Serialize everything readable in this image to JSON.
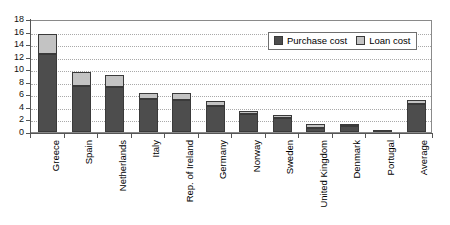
{
  "chart_data": {
    "type": "bar",
    "title": "",
    "subtitle": "",
    "xlabel": "",
    "ylabel": "",
    "stacked": true,
    "grid": true,
    "legend_position": "top-right",
    "ylim": [
      0,
      18
    ],
    "ytick_step": 2,
    "yticks": [
      "0",
      "2",
      "4",
      "6",
      "8",
      "10",
      "12",
      "14",
      "16",
      "18"
    ],
    "categories": [
      "Greece",
      "Spain",
      "Netherlands",
      "Italy",
      "Rep. of Ireland",
      "Germany",
      "Norway",
      "Sweden",
      "United Kingdom",
      "Denmark",
      "Portugal",
      "Average"
    ],
    "series": [
      {
        "name": "Purchase cost",
        "color": "#4d4d4d",
        "values": [
          12.5,
          7.3,
          7.1,
          5.2,
          5.1,
          4.1,
          2.9,
          2.2,
          0.7,
          1.0,
          0.3,
          4.5
        ]
      },
      {
        "name": "Loan cost",
        "color": "#c3c3c3",
        "values": [
          3.1,
          2.2,
          2.0,
          1.0,
          1.1,
          0.9,
          0.4,
          0.5,
          0.5,
          0.3,
          0.0,
          0.6
        ]
      }
    ],
    "totals": [
      15.6,
      9.5,
      9.1,
      6.2,
      6.2,
      5.0,
      3.3,
      2.7,
      1.2,
      1.3,
      0.3,
      5.1
    ]
  },
  "legend": {
    "items": [
      {
        "label": "Purchase cost",
        "swatch": "purchase"
      },
      {
        "label": "Loan cost",
        "swatch": "loan"
      }
    ]
  }
}
